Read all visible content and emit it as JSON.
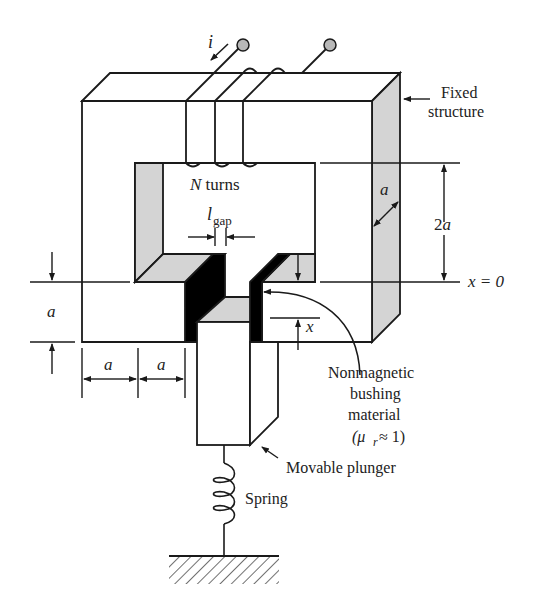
{
  "labels": {
    "current": "i",
    "fixed_structure_line1": "Fixed",
    "fixed_structure_line2": "structure",
    "n_turns_var": "N",
    "n_turns_text": " turns",
    "lgap_main": "l",
    "lgap_sub": "gap",
    "depth_a": "a",
    "height_2a": "2a",
    "x_zero": "x = 0",
    "x_disp": "x",
    "left_a": "a",
    "bottom_a1": "a",
    "bottom_a2": "a",
    "bushing_line1": "Nonmagnetic",
    "bushing_line2": "bushing",
    "bushing_line3": "material",
    "bushing_line4": "(μ",
    "bushing_sub": "r",
    "bushing_line4b": " ≈ 1)",
    "plunger": "Movable plunger",
    "spring": "Spring"
  },
  "colors": {
    "stroke": "#1a1a1a",
    "shade": "#d4d4d4",
    "bushing": "#000000",
    "terminal": "#b8b8b8",
    "background": "#ffffff"
  }
}
